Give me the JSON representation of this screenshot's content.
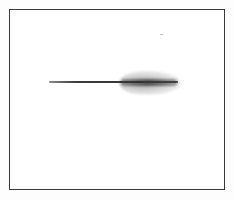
{
  "image": {
    "description": "Scanned monochrome figure: a thin horizontal dark streak inside a rectangular border frame, with a diffuse grey smear along the right portion of the streak",
    "colors": {
      "background": "#ffffff",
      "frame": "#3a3a3a",
      "streak": "#333333",
      "smear": "#7a7a7a"
    },
    "frame": {
      "left": 9,
      "top": 9,
      "right": 225,
      "bottom": 190
    },
    "streak": {
      "x_start": 49,
      "x_end": 177,
      "y": 82,
      "thickness": 2
    },
    "smear": {
      "x_start": 120,
      "x_end": 178,
      "y_top": 72,
      "y_bottom": 94
    },
    "speck": {
      "x": 160,
      "y": 34
    }
  }
}
